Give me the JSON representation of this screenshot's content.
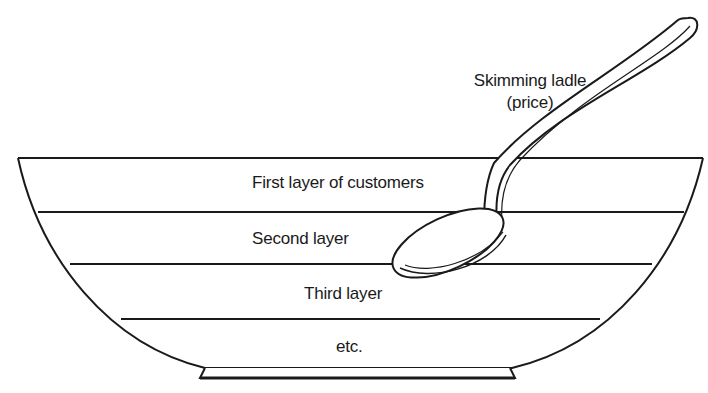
{
  "diagram": {
    "ladle_label": {
      "line1": "Skimming ladle",
      "line2": "(price)"
    },
    "layers": [
      {
        "label": "First layer of customers"
      },
      {
        "label": "Second layer"
      },
      {
        "label": "Third layer"
      },
      {
        "label": "etc."
      }
    ],
    "colors": {
      "line": "#1a1a1a",
      "background": "#ffffff"
    }
  }
}
